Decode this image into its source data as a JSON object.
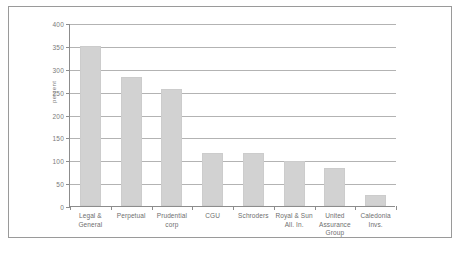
{
  "chart_data": {
    "type": "bar",
    "title": "",
    "subtitle": "",
    "xlabel": "",
    "ylabel": "percent",
    "ylim": [
      0,
      400
    ],
    "ytick_labels": [
      "0",
      "50",
      "100",
      "150",
      "200",
      "250",
      "300",
      "350",
      "400"
    ],
    "ytick_values": [
      0,
      50,
      100,
      150,
      200,
      250,
      300,
      350,
      400
    ],
    "grid": true,
    "legend": "none",
    "bar_color": "#d2d2d2",
    "axis_color": "#8c8c8c",
    "grid_color": "#b3b3b3",
    "text_color": "#6e6e6e",
    "categories": [
      "Legal & General",
      "Perpetual",
      "Prudential corp",
      "CGU",
      "Schroders",
      "Royal & Sun All. In.",
      "United Assurance Group",
      "Caledonia Invs."
    ],
    "category_lines": [
      [
        "Legal &",
        "General"
      ],
      [
        "Perpetual"
      ],
      [
        "Prudential",
        "corp"
      ],
      [
        "CGU"
      ],
      [
        "Schroders"
      ],
      [
        "Royal & Sun",
        "All. In."
      ],
      [
        "United",
        "Assurance",
        "Group"
      ],
      [
        "Caledonia",
        "Invs."
      ]
    ],
    "values": [
      350,
      283,
      255,
      115,
      115,
      98,
      83,
      23
    ]
  }
}
